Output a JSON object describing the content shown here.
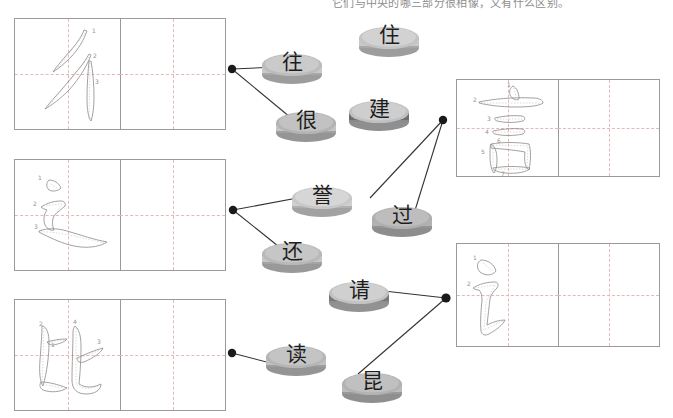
{
  "page": {
    "instruction": "它们与中央的哪三部分很相像，又有什么区别。",
    "background_color": "#ffffff",
    "grid_border_color": "#9a9a9a",
    "grid_dash_color": "#e3b9bb",
    "connector_color": "#333333",
    "token_color": "#b3b3b3",
    "stroke_number_color": "#9d8f86"
  },
  "left_boxes": [
    {
      "id": "radical-chi",
      "character": "彳",
      "stroke_numbers": [
        "1",
        "2",
        "3"
      ],
      "filled_cell": "left",
      "empty_cell": "right"
    },
    {
      "id": "radical-chuo",
      "character": "辶",
      "stroke_numbers": [
        "1",
        "2",
        "3"
      ],
      "filled_cell": "left",
      "empty_cell": "right"
    },
    {
      "id": "character-bi",
      "character": "比",
      "stroke_numbers": [
        "1",
        "2",
        "3",
        "4"
      ],
      "filled_cell": "left",
      "empty_cell": "right"
    }
  ],
  "right_boxes": [
    {
      "id": "radical-yan-full",
      "character": "言",
      "stroke_numbers": [
        "1",
        "2",
        "3",
        "4",
        "5",
        "6",
        "7"
      ],
      "filled_cell": "left",
      "empty_cell": "right"
    },
    {
      "id": "radical-yan-simplified",
      "character": "讠",
      "stroke_numbers": [
        "1",
        "2"
      ],
      "filled_cell": "left",
      "empty_cell": "right"
    }
  ],
  "tokens": [
    {
      "id": "token-zhu",
      "char": "住",
      "x": 355,
      "y": 18
    },
    {
      "id": "token-wang",
      "char": "往",
      "x": 258,
      "y": 45
    },
    {
      "id": "token-hen",
      "char": "很",
      "x": 272,
      "y": 103
    },
    {
      "id": "token-jian",
      "char": "建",
      "x": 345,
      "y": 92
    },
    {
      "id": "token-yu",
      "char": "誉",
      "x": 288,
      "y": 178
    },
    {
      "id": "token-guo",
      "char": "过",
      "x": 368,
      "y": 198
    },
    {
      "id": "token-hai",
      "char": "还",
      "x": 258,
      "y": 234
    },
    {
      "id": "token-qing",
      "char": "请",
      "x": 325,
      "y": 273
    },
    {
      "id": "token-du",
      "char": "读",
      "x": 262,
      "y": 337
    },
    {
      "id": "token-kun",
      "char": "昆",
      "x": 338,
      "y": 364
    }
  ],
  "connectors": {
    "nodes": [
      {
        "id": "node-left-chi",
        "x": 232,
        "y": 69,
        "side": "left"
      },
      {
        "id": "node-left-chuo",
        "x": 233,
        "y": 210,
        "side": "left"
      },
      {
        "id": "node-left-bi",
        "x": 232,
        "y": 353,
        "side": "left"
      },
      {
        "id": "node-right-yan",
        "x": 443,
        "y": 120,
        "side": "right"
      },
      {
        "id": "node-right-yanj",
        "x": 446,
        "y": 298,
        "side": "right"
      }
    ],
    "lines": [
      {
        "id": "line-chi-wang",
        "from": [
          232,
          69
        ],
        "to": [
          275,
          66
        ]
      },
      {
        "id": "line-chi-hen",
        "from": [
          232,
          69
        ],
        "to": [
          300,
          125
        ]
      },
      {
        "id": "line-chuo-yu",
        "from": [
          233,
          210
        ],
        "to": [
          305,
          196
        ]
      },
      {
        "id": "line-chuo-hai",
        "from": [
          233,
          210
        ],
        "to": [
          285,
          252
        ]
      },
      {
        "id": "line-bi-du",
        "from": [
          232,
          353
        ],
        "to": [
          300,
          370
        ]
      },
      {
        "id": "line-yan-jian",
        "from": [
          443,
          120
        ],
        "to": [
          372,
          196
        ]
      },
      {
        "id": "line-yan-guo",
        "from": [
          443,
          120
        ],
        "to": [
          415,
          219
        ]
      },
      {
        "id": "line-yanj-qing",
        "from": [
          446,
          298
        ],
        "to": [
          382,
          290
        ]
      },
      {
        "id": "line-yanj-kun",
        "from": [
          446,
          298
        ],
        "to": [
          360,
          372
        ]
      }
    ]
  }
}
